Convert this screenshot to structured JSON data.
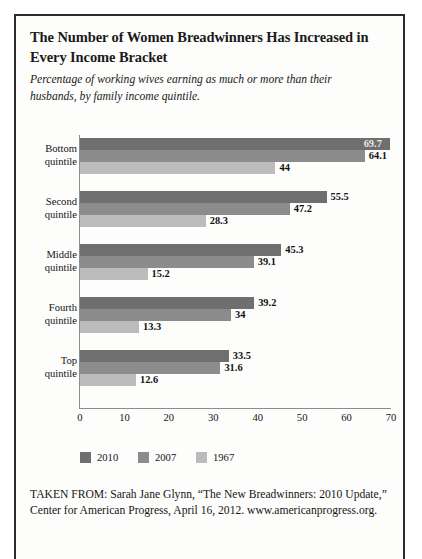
{
  "figure": {
    "title": "The Number of Women Breadwinners Has Increased in Every Income Bracket",
    "subtitle": "Percentage of working wives earning as much or more than their husbands, by family income quintile.",
    "source_note": "TAKEN FROM: Sarah Jane Glynn, “The New Breadwinners: 2010 Update,” Center for American Progress, April 16, 2012. www.americanprogress.org."
  },
  "colors": {
    "series_2010": "#6f6f6f",
    "series_2007": "#8c8c8c",
    "series_1967": "#bcbcbc",
    "frame": "#2b2b2b",
    "axis": "#8d8d8d"
  },
  "chart_data": {
    "type": "bar",
    "orientation": "horizontal",
    "title": "The Number of Women Breadwinners Has Increased in Every Income Bracket",
    "subtitle": "Percentage of working wives earning as much or more than their husbands, by family income quintile.",
    "xlabel": "",
    "ylabel": "",
    "xlim": [
      0,
      70
    ],
    "xticks": [
      0,
      10,
      20,
      30,
      40,
      50,
      60,
      70
    ],
    "grid": false,
    "legend_position": "bottom",
    "categories": [
      "Bottom quintile",
      "Second quintile",
      "Middle quintile",
      "Fourth quintile",
      "Top quintile"
    ],
    "category_lines": [
      [
        "Bottom",
        "quintile"
      ],
      [
        "Second",
        "quintile"
      ],
      [
        "Middle",
        "quintile"
      ],
      [
        "Fourth",
        "quintile"
      ],
      [
        "Top",
        "quintile"
      ]
    ],
    "series": [
      {
        "name": "2010",
        "color": "#6f6f6f",
        "values": [
          69.7,
          55.5,
          45.3,
          39.2,
          33.5
        ],
        "labels": [
          "69.7",
          "55.5",
          "45.3",
          "39.2",
          "33.5"
        ]
      },
      {
        "name": "2007",
        "color": "#8c8c8c",
        "values": [
          64.1,
          47.2,
          39.1,
          34,
          31.6
        ],
        "labels": [
          "64.1",
          "47.2",
          "39.1",
          "34",
          "31.6"
        ]
      },
      {
        "name": "1967",
        "color": "#bcbcbc",
        "values": [
          44,
          28.3,
          15.2,
          13.3,
          12.6
        ],
        "labels": [
          "44",
          "28.3",
          "15.2",
          "13.3",
          "12.6"
        ]
      }
    ]
  },
  "legend": {
    "items": [
      {
        "label": "2010",
        "key": "s2010"
      },
      {
        "label": "2007",
        "key": "s2007"
      },
      {
        "label": "1967",
        "key": "s1967"
      }
    ]
  }
}
